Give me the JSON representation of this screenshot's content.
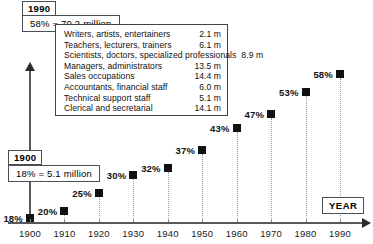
{
  "chart_data": {
    "type": "scatter",
    "title": "",
    "xlabel": "YEAR",
    "ylabel": "",
    "categories": [
      "1900",
      "1910",
      "1920",
      "1930",
      "1940",
      "1950",
      "1960",
      "1970",
      "1980",
      "1990"
    ],
    "values": [
      18,
      20,
      25,
      30,
      32,
      37,
      43,
      47,
      53,
      58
    ],
    "point_labels": [
      "18%",
      "20%",
      "25%",
      "30%",
      "32%",
      "37%",
      "43%",
      "47%",
      "53%",
      "58%"
    ],
    "xlim": [
      1900,
      1990
    ],
    "ylim": [
      18,
      58
    ],
    "grid": "vertical-dotted-droplines",
    "legend": "none",
    "marker_color": "#111111",
    "axis_color": "#555a5e"
  },
  "annotations": {
    "start": {
      "year": "1900",
      "value": "18% = 5.1 million"
    },
    "end": {
      "year": "1990",
      "value": "58% = 70.2 million"
    }
  },
  "occupation_box": {
    "rows": [
      {
        "name": "Writers, artists, entertainers",
        "value": "2.1 m"
      },
      {
        "name": "Teachers, lecturers, trainers",
        "value": "6.1 m"
      },
      {
        "name": "Scientists, doctors, specialized professionals",
        "value": "8.9 m"
      },
      {
        "name": "Managers, administrators",
        "value": "13.5 m"
      },
      {
        "name": "Sales occupations",
        "value": "14.4 m"
      },
      {
        "name": "Accountants, financial staff",
        "value": "6.0 m"
      },
      {
        "name": "Technical support staff",
        "value": "5.1 m"
      },
      {
        "name": "Clerical and secretarial",
        "value": "14.1 m"
      }
    ]
  },
  "axis_label_box": {
    "text": "YEAR"
  }
}
